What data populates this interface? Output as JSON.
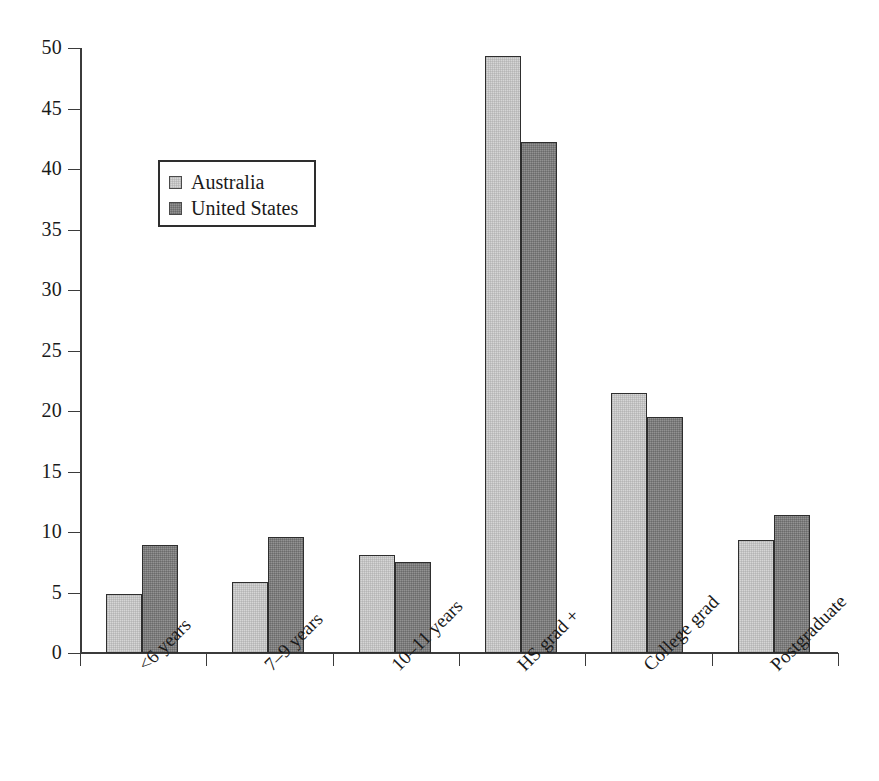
{
  "chart_data": {
    "type": "bar",
    "title": "",
    "subtitle": "",
    "xlabel": "",
    "ylabel": "",
    "ylim": [
      0,
      50
    ],
    "ytick_labels": [
      "0",
      "5",
      "10",
      "15",
      "20",
      "25",
      "30",
      "35",
      "40",
      "45",
      "50"
    ],
    "ytick_values": [
      0,
      5,
      10,
      15,
      20,
      25,
      30,
      35,
      40,
      45,
      50
    ],
    "grid": false,
    "legend_position": "upper-left-inside",
    "categories": [
      "<6 years",
      "7–9 years",
      "10–11 years",
      "HS grad +",
      "College grad",
      "Postgraduate"
    ],
    "series": [
      {
        "name": "Australia",
        "color": "#d6d6d6",
        "values": [
          4.9,
          5.9,
          8.1,
          49.3,
          21.5,
          9.3
        ]
      },
      {
        "name": "United States",
        "color": "#7e7e7e",
        "values": [
          8.9,
          9.6,
          7.5,
          42.2,
          19.5,
          11.4
        ]
      }
    ]
  },
  "legend": {
    "entries": [
      {
        "label": "Australia",
        "swatch": "legend-swatch-australia"
      },
      {
        "label": "United States",
        "swatch": "legend-swatch-united-states"
      }
    ]
  },
  "colors": {
    "series_a": "#d6d6d6",
    "series_b": "#7e7e7e",
    "axis": "#3b3b3b",
    "bar_border": "#2e2e2e",
    "background": "#ffffff",
    "text": "#1a1a1a"
  }
}
